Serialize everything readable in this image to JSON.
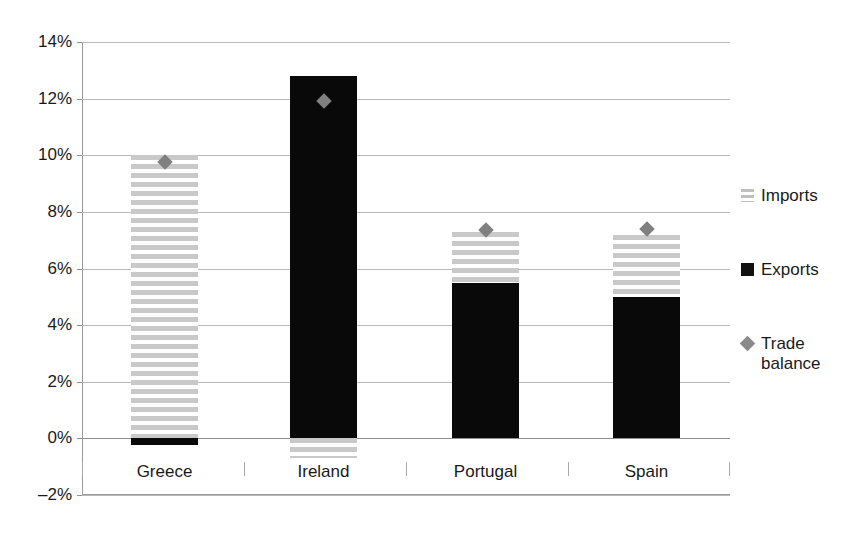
{
  "chart_data": {
    "type": "bar",
    "title": "",
    "subtitle": "",
    "xlabel": "",
    "ylabel": "",
    "categories": [
      "Greece",
      "Ireland",
      "Portugal",
      "Spain"
    ],
    "ylim": [
      -2,
      14
    ],
    "ytick_labels": [
      "14%",
      "12%",
      "10%",
      "8%",
      "6%",
      "4%",
      "2%",
      "0%",
      "–2%"
    ],
    "ytick_values": [
      14,
      12,
      10,
      8,
      6,
      4,
      2,
      0,
      -2
    ],
    "y_unit": "%",
    "grid": true,
    "stacked": true,
    "legend_position": "right",
    "series": [
      {
        "name": "Imports",
        "type": "bar",
        "style": "horizontal-striped",
        "color": "#c9c9c9",
        "values": [
          10.0,
          -0.7,
          1.8,
          2.2
        ]
      },
      {
        "name": "Exports",
        "type": "bar",
        "style": "solid",
        "color": "#090909",
        "values": [
          -0.25,
          12.8,
          5.5,
          5.0
        ]
      },
      {
        "name": "Trade balance",
        "type": "scatter",
        "style": "diamond-marker",
        "color": "#808080",
        "values": [
          9.75,
          11.9,
          7.35,
          7.4
        ]
      }
    ],
    "bar_segments": [
      {
        "category": "Greece",
        "imports_top": 10.0,
        "imports_bottom": 0.0,
        "exports_top": 0.0,
        "exports_bottom": -0.25,
        "trade_balance": 9.75
      },
      {
        "category": "Ireland",
        "imports_top": 0.0,
        "imports_bottom": -0.7,
        "exports_top": 12.8,
        "exports_bottom": 0.0,
        "trade_balance": 11.9
      },
      {
        "category": "Portugal",
        "imports_top": 7.3,
        "imports_bottom": 5.5,
        "exports_top": 5.5,
        "exports_bottom": 0.0,
        "trade_balance": 7.35
      },
      {
        "category": "Spain",
        "imports_top": 7.2,
        "imports_bottom": 5.0,
        "exports_top": 5.0,
        "exports_bottom": 0.0,
        "trade_balance": 7.4
      }
    ],
    "legend": [
      {
        "label": "Imports",
        "swatch": "striped"
      },
      {
        "label": "Exports",
        "swatch": "solid-black"
      },
      {
        "label": "Trade balance",
        "swatch": "gray-diamond"
      }
    ]
  }
}
